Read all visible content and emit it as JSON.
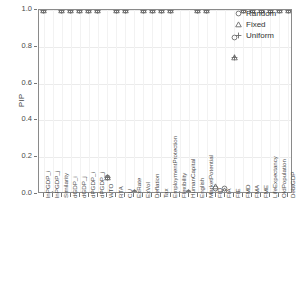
{
  "chart_data": {
    "type": "scatter",
    "title": "",
    "xlabel": "",
    "ylabel": "PIP",
    "ylim": [
      0.0,
      1.0
    ],
    "yticks": [
      "0.0",
      "0.2",
      "0.4",
      "0.6",
      "0.8",
      "1.0"
    ],
    "ytick_values": [
      0.0,
      0.2,
      0.4,
      0.6,
      0.8,
      1.0
    ],
    "grid": true,
    "legend_position": "top-right",
    "categories": [
      "lnPGDP_i",
      "lnPGDP_j",
      "Similarity",
      "dGDP_i",
      "dGDP_j",
      "dPGDP_i",
      "dPGDP_j",
      "WTO",
      "RTA",
      "CU",
      "ExRate",
      "ExVol",
      "Deflation",
      "Tax",
      "EmploymentProtection",
      "Flexibility",
      "HumanCapital",
      "English",
      "MarketPotential",
      "FID",
      "FIA",
      "FIE",
      "FMD",
      "FMA",
      "FME",
      "LifeExpectancy",
      "OldPopulation",
      "DebtGDP"
    ],
    "series": [
      {
        "name": "Random",
        "marker": "circle",
        "values": [
          1.0,
          0.0,
          1.0,
          1.0,
          1.0,
          1.0,
          1.0,
          0.09,
          1.0,
          1.0,
          0.01,
          1.0,
          1.0,
          1.0,
          1.0,
          0.0,
          0.01,
          1.0,
          1.0,
          0.03,
          0.03,
          0.85,
          1.0,
          1.0,
          1.0,
          1.0,
          1.0,
          1.0
        ]
      },
      {
        "name": "Fixed",
        "marker": "triangle",
        "values": [
          1.0,
          0.0,
          1.0,
          1.0,
          1.0,
          1.0,
          1.0,
          0.09,
          1.0,
          1.0,
          0.01,
          1.0,
          1.0,
          1.0,
          1.0,
          0.0,
          0.01,
          1.0,
          1.0,
          0.04,
          0.02,
          0.74,
          1.0,
          1.0,
          1.0,
          1.0,
          1.0,
          1.0
        ]
      },
      {
        "name": "Uniform",
        "marker": "plus",
        "values": [
          1.0,
          0.0,
          1.0,
          1.0,
          1.0,
          1.0,
          1.0,
          0.09,
          1.0,
          1.0,
          0.01,
          1.0,
          1.0,
          1.0,
          1.0,
          0.0,
          0.01,
          1.0,
          1.0,
          0.0,
          0.0,
          0.74,
          1.0,
          1.0,
          1.0,
          1.0,
          1.0,
          1.0
        ]
      }
    ]
  },
  "legend": {
    "items": [
      {
        "label": "Random",
        "marker": "circle"
      },
      {
        "label": "Fixed",
        "marker": "triangle"
      },
      {
        "label": "Uniform",
        "marker": "plus"
      }
    ]
  },
  "colors": {
    "marker": "#6b6b6b",
    "panel_border": "#8a8a8a",
    "gridline": "#ebebeb",
    "text": "#4a4a4a"
  }
}
